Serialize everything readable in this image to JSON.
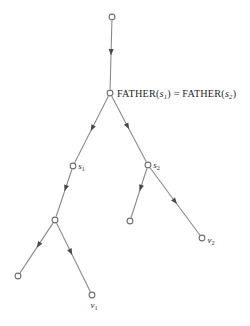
{
  "figure": {
    "type": "tree-diagram",
    "background_color": "#ffffff",
    "line_color": "#8a8a8a",
    "arrow_color": "#4a4a4a",
    "node_stroke_color": "#6f6f6f",
    "node_fill_color": "#ffffff",
    "text_color": "#1f1f1f"
  },
  "labels": {
    "father_equation": {
      "prefix_left": "FATHER(",
      "var_left": "s",
      "sub_left": "1",
      "close_left": ")",
      "equals": "=",
      "prefix_right": "FATHER(",
      "var_right": "s",
      "sub_right": "2",
      "close_right": ")",
      "full_text": "FATHER(s1) = FATHER(s2)"
    },
    "s1": {
      "var": "s",
      "sub": "1"
    },
    "s2": {
      "var": "s",
      "sub": "2"
    },
    "v1": {
      "var": "v",
      "sub": "1"
    },
    "v2": {
      "var": "v",
      "sub": "2"
    }
  },
  "nodes": [
    {
      "id": "root",
      "name": "root-node",
      "x": 112,
      "y": 17,
      "r": 2.9,
      "label": null
    },
    {
      "id": "father",
      "name": "father-node",
      "x": 110,
      "y": 93,
      "r": 2.9,
      "label": "father_equation"
    },
    {
      "id": "s1",
      "name": "s1-node",
      "x": 73,
      "y": 166,
      "r": 2.9,
      "label": "s1"
    },
    {
      "id": "s2",
      "name": "s2-node",
      "x": 148,
      "y": 165,
      "r": 2.9,
      "label": "s2"
    },
    {
      "id": "mid_left",
      "name": "left-branch-node",
      "x": 55,
      "y": 220,
      "r": 2.9,
      "label": null
    },
    {
      "id": "leaf_mid",
      "name": "s2-left-leaf-node",
      "x": 130,
      "y": 221,
      "r": 2.9,
      "label": null
    },
    {
      "id": "v2",
      "name": "v2-leaf-node",
      "x": 202,
      "y": 238,
      "r": 2.9,
      "label": "v2"
    },
    {
      "id": "leaf_bl",
      "name": "bottom-left-leaf-node",
      "x": 18,
      "y": 276,
      "r": 2.9,
      "label": null
    },
    {
      "id": "v1",
      "name": "v1-leaf-node",
      "x": 92,
      "y": 295,
      "r": 2.9,
      "label": "v1"
    }
  ],
  "edges": [
    {
      "id": "root_father",
      "name": "edge-root-to-father",
      "from": "root",
      "to": "father",
      "arrow_t": 0.46
    },
    {
      "id": "father_s1",
      "name": "edge-father-to-s1",
      "from": "father",
      "to": "s1",
      "arrow_t": 0.48
    },
    {
      "id": "father_s2",
      "name": "edge-father-to-s2",
      "from": "father",
      "to": "s2",
      "arrow_t": 0.46
    },
    {
      "id": "s1_midleft",
      "name": "edge-s1-to-left-node",
      "from": "s1",
      "to": "mid_left",
      "arrow_t": 0.4
    },
    {
      "id": "s2_leafmid",
      "name": "edge-s2-to-left-leaf",
      "from": "s2",
      "to": "leaf_mid",
      "arrow_t": 0.4
    },
    {
      "id": "s2_v2",
      "name": "edge-s2-to-v2",
      "from": "s2",
      "to": "v2",
      "arrow_t": 0.5
    },
    {
      "id": "midleft_leafbl",
      "name": "edge-left-node-to-bl",
      "from": "mid_left",
      "to": "leaf_bl",
      "arrow_t": 0.44
    },
    {
      "id": "midleft_v1",
      "name": "edge-left-node-to-v1",
      "from": "mid_left",
      "to": "v1",
      "arrow_t": 0.42
    }
  ],
  "label_offsets": {
    "father_equation": {
      "dx": 7,
      "dy": 3.6
    },
    "s1": {
      "dx": 5.2,
      "dy": 3.2
    },
    "s2": {
      "dx": 5.2,
      "dy": 3.2
    },
    "v1": {
      "dx": -1.5,
      "dy": 12.5
    },
    "v2": {
      "dx": 5.5,
      "dy": 4.5
    }
  }
}
